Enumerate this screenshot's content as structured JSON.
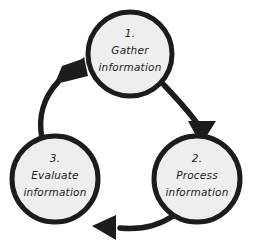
{
  "diagram": {
    "background_color": "#ffffff",
    "node_fill": "#eeeeee",
    "node_stroke": "#1c1c1c",
    "arrow_color": "#1c1c1c",
    "text_color": "#1c1c1c",
    "direction": "clockwise",
    "nodes": [
      {
        "id": "gather",
        "number": "1.",
        "line1": "Gather",
        "line2": "information",
        "cx": 130,
        "cy": 54,
        "r": 42
      },
      {
        "id": "process",
        "number": "2.",
        "line1": "Process",
        "line2": "information",
        "cx": 197,
        "cy": 179,
        "r": 43
      },
      {
        "id": "evaluate",
        "number": "3.",
        "line1": "Evaluate",
        "line2": "information",
        "cx": 55,
        "cy": 179,
        "r": 43
      }
    ],
    "arrows": [
      {
        "id": "gather-to-process",
        "from": "gather",
        "to": "process"
      },
      {
        "id": "process-to-evaluate",
        "from": "process",
        "to": "evaluate"
      },
      {
        "id": "evaluate-to-gather",
        "from": "evaluate",
        "to": "gather"
      }
    ]
  }
}
